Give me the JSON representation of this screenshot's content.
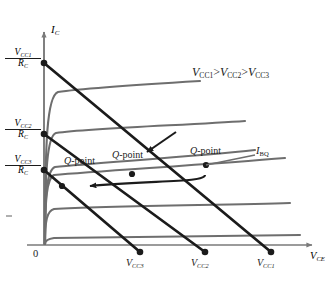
{
  "figure": {
    "axes": {
      "y_label": "I_C",
      "y_label_main": "I",
      "y_label_sub": "C",
      "x_label_main": "V",
      "x_label_sub": "CE",
      "origin_label": "0"
    },
    "colors": {
      "load_line": "#1b1b1b",
      "curve": "#6e6e6e",
      "axis": "#7a7a7a",
      "text": "#1b1b1b",
      "background": "#ffffff"
    },
    "inequality": {
      "v1_main": "V",
      "v1_sub": "CC1",
      "gt1": ">",
      "v2_main": "V",
      "v2_sub": "CC2",
      "gt2": ">",
      "v3_main": "V",
      "v3_sub": "CC3"
    },
    "y_intercepts": [
      {
        "id": "vcc1-rc",
        "num_main": "V",
        "num_sub": "CC1",
        "den": "R",
        "den_sub": "C",
        "x": 44,
        "y": 63
      },
      {
        "id": "vcc2-rc",
        "num_main": "V",
        "num_sub": "CC2",
        "den": "R",
        "den_sub": "C",
        "x": 44,
        "y": 134
      },
      {
        "id": "vcc3-rc",
        "num_main": "V",
        "num_sub": "CC3",
        "den": "R",
        "den_sub": "C",
        "x": 44,
        "y": 170
      }
    ],
    "x_intercepts": [
      {
        "id": "vcc3",
        "main": "V",
        "sub": "CC3",
        "x": 140,
        "y": 252
      },
      {
        "id": "vcc2",
        "main": "V",
        "sub": "CC2",
        "x": 205,
        "y": 252
      },
      {
        "id": "vcc1",
        "main": "V",
        "sub": "CC1",
        "x": 271,
        "y": 252
      }
    ],
    "load_lines": [
      {
        "id": "load-line-vcc3",
        "x1": 44,
        "y1": 170,
        "x2": 140,
        "y2": 252
      },
      {
        "id": "load-line-vcc2",
        "x1": 44,
        "y1": 134,
        "x2": 205,
        "y2": 252
      },
      {
        "id": "load-line-vcc1",
        "x1": 44,
        "y1": 63,
        "x2": 271,
        "y2": 252
      }
    ],
    "q_points": [
      {
        "id": "q-point-1",
        "label": "Q",
        "suffix": "-point",
        "px": 62,
        "py": 186,
        "lx": 69,
        "ly": 160
      },
      {
        "id": "q-point-2",
        "label": "Q",
        "suffix": "-point",
        "px": 132,
        "py": 174,
        "lx": 113,
        "ly": 153
      },
      {
        "id": "q-point-3",
        "label": "Q",
        "suffix": "-point",
        "px": 206,
        "py": 165,
        "lx": 195,
        "ly": 150
      }
    ],
    "ib_label": {
      "id": "ibq-label",
      "main": "I",
      "sub": "BQ",
      "x": 259,
      "y": 150
    },
    "curves": [
      {
        "id": "curve-ib-5",
        "knee_x": 52,
        "y_left": 90,
        "x_end": 200,
        "y_end": 82
      },
      {
        "id": "curve-ib-4",
        "knee_x": 50,
        "y_left": 131,
        "x_end": 245,
        "y_end": 122
      },
      {
        "id": "curve-ib-3",
        "knee_x": 49,
        "y_left": 166,
        "x_end": 255,
        "y_end": 150
      },
      {
        "id": "curve-ib-2",
        "knee_x": 48,
        "y_left": 174,
        "x_end": 285,
        "y_end": 158
      },
      {
        "id": "curve-ib-1",
        "knee_x": 47,
        "y_left": 208,
        "x_end": 290,
        "y_end": 203
      },
      {
        "id": "curve-ib-0",
        "knee_x": 46,
        "y_left": 238,
        "x_end": 300,
        "y_end": 235
      }
    ],
    "arrows": [
      {
        "id": "arrow-down-left",
        "x1": 176,
        "y1": 132,
        "x2": 145,
        "y2": 153
      },
      {
        "id": "arrow-left",
        "x1": 205,
        "y1": 176,
        "x2": 84,
        "y2": 187
      }
    ]
  }
}
